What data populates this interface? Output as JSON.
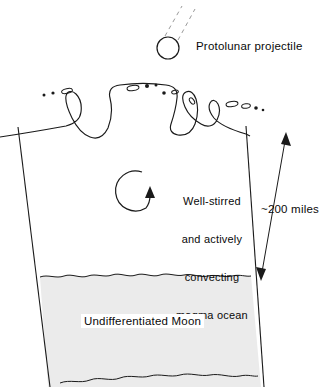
{
  "diagram": {
    "background_color": "#ffffff",
    "stroke_color": "#1a1a1a",
    "magma_fill": "#ffffff",
    "moon_fill": "#ebebeb",
    "labels": {
      "projectile": "Protolunar projectile",
      "magma_line1": "Well-stirred",
      "magma_line2": "and actively",
      "magma_line3": "convecting",
      "magma_line4": "magma ocean",
      "scale": "~200 miles",
      "moon": "Undifferentiated Moon"
    },
    "icons": {
      "projectile": "projectile-circle-icon",
      "trajectory": "dashed-trajectory-icon",
      "convection": "circular-arrow-icon",
      "dimension": "double-headed-arrow-icon",
      "splash": "magma-splash-icon",
      "droplets": "ejected-droplets-icon"
    },
    "measurements": {
      "depth_value": "200",
      "depth_unit": "miles",
      "depth_approx": true
    }
  }
}
